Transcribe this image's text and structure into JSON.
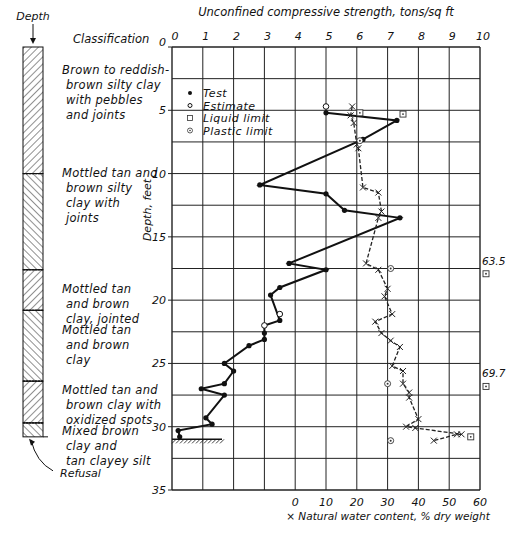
{
  "chart_data": {
    "type": "line",
    "title": "Unconfined compressive strength, tons/sq ft",
    "xlabel_top": "Unconfined compressive strength, tons/sq ft",
    "xlabel_bottom": "× Natural water content, % dry weight",
    "ylabel": "Depth, feet",
    "x_top_ticks": [
      "0",
      "1",
      "2",
      "3",
      "4",
      "5",
      "6",
      "7",
      "8",
      "9",
      "10"
    ],
    "x_bottom_ticks": [
      "0",
      "10",
      "20",
      "30",
      "40",
      "50",
      "60"
    ],
    "y_ticks": [
      "0",
      "5",
      "10",
      "15",
      "20",
      "25",
      "30",
      "35"
    ],
    "xlim_strength": [
      0,
      10
    ],
    "xlim_water": [
      -40,
      60
    ],
    "ylim": [
      0,
      35
    ],
    "grid": {
      "x_step": 1,
      "y_step": 2.5
    },
    "legend": [
      {
        "label": "Test",
        "marker": "filled-circle"
      },
      {
        "label": "Estimate",
        "marker": "open-circle"
      },
      {
        "label": "Liquid limit",
        "marker": "boxed-dot"
      },
      {
        "label": "Plastic limit",
        "marker": "circled-dot"
      }
    ],
    "series": [
      {
        "name": "Unconfined compressive strength (Test)",
        "axis": "strength",
        "style": "solid",
        "points": [
          [
            5.0,
            5.2
          ],
          [
            7.3,
            5.8
          ],
          [
            6.2,
            7.3
          ],
          [
            2.85,
            10.9
          ],
          [
            5.0,
            11.6
          ],
          [
            5.6,
            12.9
          ],
          [
            7.4,
            13.5
          ],
          [
            3.8,
            17.1
          ],
          [
            5.0,
            17.6
          ],
          [
            3.5,
            19.0
          ],
          [
            3.2,
            19.6
          ],
          [
            3.5,
            21.6
          ],
          [
            3.0,
            22.0
          ],
          [
            3.0,
            22.6
          ],
          [
            3.0,
            23.1
          ],
          [
            2.5,
            23.6
          ],
          [
            1.7,
            25.0
          ],
          [
            2.0,
            25.6
          ],
          [
            1.7,
            26.6
          ],
          [
            0.95,
            27.0
          ],
          [
            1.7,
            27.5
          ],
          [
            1.1,
            29.3
          ],
          [
            1.3,
            29.8
          ],
          [
            0.2,
            30.3
          ],
          [
            0.25,
            30.8
          ]
        ],
        "filled_markers": [
          [
            5.0,
            5.2
          ],
          [
            7.3,
            5.8
          ],
          [
            6.2,
            7.3
          ],
          [
            2.85,
            10.9
          ],
          [
            5.0,
            11.6
          ],
          [
            5.6,
            12.9
          ],
          [
            7.4,
            13.5
          ],
          [
            3.8,
            17.1
          ],
          [
            5.0,
            17.6
          ],
          [
            3.5,
            19.0
          ],
          [
            3.2,
            19.6
          ],
          [
            3.5,
            21.6
          ],
          [
            3.0,
            22.6
          ],
          [
            3.0,
            23.1
          ],
          [
            2.5,
            23.6
          ],
          [
            1.7,
            25.0
          ],
          [
            2.0,
            25.6
          ],
          [
            1.7,
            26.6
          ],
          [
            0.95,
            27.0
          ],
          [
            1.7,
            27.5
          ],
          [
            1.1,
            29.3
          ],
          [
            1.3,
            29.8
          ],
          [
            0.2,
            30.3
          ],
          [
            0.25,
            30.8
          ]
        ]
      },
      {
        "name": "Unconfined compressive strength (Estimate)",
        "axis": "strength",
        "style": "marker-only",
        "points": [
          [
            5.0,
            4.7
          ],
          [
            3.5,
            21.1
          ],
          [
            3.0,
            22.0
          ]
        ]
      },
      {
        "name": "Natural water content",
        "axis": "water",
        "style": "dashed",
        "marker": "x",
        "points": [
          [
            18.5,
            4.7
          ],
          [
            18.0,
            5.4
          ],
          [
            19.0,
            6.0
          ],
          [
            20.0,
            7.7
          ],
          [
            20.5,
            8.0
          ],
          [
            22.0,
            11.1
          ],
          [
            27.0,
            11.5
          ],
          [
            28.0,
            13.0
          ],
          [
            27.0,
            13.5
          ],
          [
            23.0,
            17.1
          ],
          [
            27.0,
            17.6
          ],
          [
            30.0,
            19.1
          ],
          [
            29.0,
            19.7
          ],
          [
            31.5,
            21.1
          ],
          [
            26.0,
            21.7
          ],
          [
            28.0,
            22.6
          ],
          [
            31.0,
            23.2
          ],
          [
            34.0,
            23.7
          ],
          [
            31.5,
            25.2
          ],
          [
            35.0,
            25.6
          ],
          [
            35.0,
            26.6
          ],
          [
            37.0,
            27.3
          ],
          [
            37.0,
            27.7
          ],
          [
            40.0,
            29.4
          ],
          [
            36.0,
            30.0
          ],
          [
            39.0,
            30.1
          ],
          [
            54.0,
            30.6
          ],
          [
            52.5,
            30.6
          ],
          [
            45.0,
            31.1
          ]
        ]
      },
      {
        "name": "Liquid limit",
        "axis": "water",
        "style": "marker-only",
        "points": [
          [
            21.0,
            5.2
          ],
          [
            35.0,
            5.3
          ],
          [
            57.0,
            30.8
          ]
        ],
        "offscale": [
          {
            "label": "63.5",
            "depth": 17.6
          },
          {
            "label": "69.7",
            "depth": 26.5
          }
        ]
      },
      {
        "name": "Plastic limit",
        "axis": "water",
        "style": "marker-only",
        "points": [
          [
            21.0,
            7.4
          ],
          [
            31.0,
            17.5
          ],
          [
            30.0,
            26.6
          ],
          [
            31.0,
            31.1
          ]
        ]
      }
    ]
  },
  "boring_log": {
    "depth_label": "Depth",
    "column_header": "Classification",
    "refusal_label": "Refusal",
    "layers": [
      {
        "top": 0,
        "bottom": 10,
        "hatch": "forward",
        "description": "Brown to reddish-\n brown silty clay\n with pebbles\n and joints"
      },
      {
        "top": 10,
        "bottom": 17.6,
        "hatch": "back",
        "description": "Mottled tan and\n brown silty\n clay with\n joints"
      },
      {
        "top": 17.6,
        "bottom": 20.8,
        "hatch": "forward",
        "description": "Mottled tan\n and brown\n clay, jointed"
      },
      {
        "top": 20.8,
        "bottom": 26.4,
        "hatch": "back",
        "description": "Mottled tan\n and brown\n clay"
      },
      {
        "top": 26.4,
        "bottom": 29.7,
        "hatch": "forward",
        "description": "Mottled tan and\n brown clay with\n oxidized spots"
      },
      {
        "top": 29.7,
        "bottom": 30.8,
        "hatch": "back",
        "description": "Mixed brown\n clay and\n tan clayey silt"
      }
    ]
  }
}
